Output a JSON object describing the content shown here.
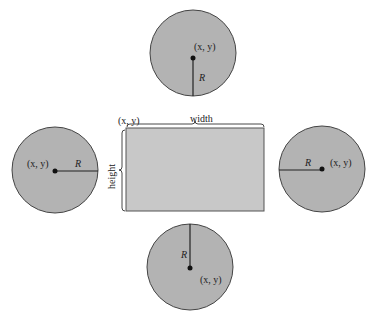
{
  "diagram": {
    "colors": {
      "fill": "#b3b3b3",
      "rect_fill": "#c8c8c8",
      "stroke": "#333333"
    },
    "rectangle": {
      "corner_label": "(x, y)",
      "width_label": "width",
      "height_label": "height"
    },
    "circles": [
      {
        "id": "top",
        "center_label": "(x, y)",
        "radius_label": "R",
        "radius_direction": "down"
      },
      {
        "id": "left",
        "center_label": "(x, y)",
        "radius_label": "R",
        "radius_direction": "right"
      },
      {
        "id": "right",
        "center_label": "(x, y)",
        "radius_label": "R",
        "radius_direction": "left"
      },
      {
        "id": "bottom",
        "center_label": "(x, y)",
        "radius_label": "R",
        "radius_direction": "up"
      }
    ]
  }
}
